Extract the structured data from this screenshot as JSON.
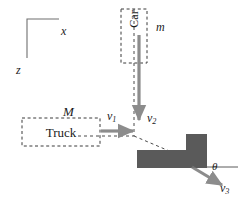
{
  "figure": {
    "background_color": "#ffffff",
    "ink_color": "#1b1b1b",
    "wreck_fill_color": "#5a5a5a",
    "arrow_color": "#8c8c8c",
    "dashed_color": "#4a4a4a"
  },
  "axes": {
    "x_label": "x",
    "z_label": "z",
    "origin_x": 27,
    "origin_y": 19,
    "x_end": 59,
    "z_end": 58
  },
  "bodies": [
    {
      "id": "car",
      "label": "Car",
      "mass_symbol": "m",
      "orientation": "vertical",
      "box": {
        "x": 121,
        "y": 9,
        "w": 26,
        "h": 54
      }
    },
    {
      "id": "truck",
      "label": "Truck",
      "mass_symbol": "M",
      "orientation": "horizontal",
      "box": {
        "x": 22,
        "y": 118,
        "w": 78,
        "h": 28
      }
    },
    {
      "id": "wreckage",
      "label": "",
      "shape": "L-polygon",
      "fill": "#5a5a5a"
    }
  ],
  "vectors": [
    {
      "id": "v1",
      "label": "v",
      "subscript": "1",
      "direction": "right",
      "belongs_to": "truck",
      "from": {
        "x": 103,
        "y": 131
      },
      "to": {
        "x": 135,
        "y": 131
      }
    },
    {
      "id": "v2",
      "label": "v",
      "subscript": "2",
      "direction": "down",
      "belongs_to": "car",
      "from": {
        "x": 139,
        "y": 37
      },
      "to": {
        "x": 139,
        "y": 123
      }
    },
    {
      "id": "v3",
      "label": "v",
      "subscript": "3",
      "direction": "down-right",
      "belongs_to": "wreckage",
      "from": {
        "x": 192,
        "y": 167
      },
      "to": {
        "x": 224,
        "y": 186
      }
    }
  ],
  "angle": {
    "symbol": "θ",
    "between": [
      "horizontal-reference",
      "v3"
    ],
    "vertex": {
      "x": 192,
      "y": 167
    }
  },
  "reference_line": {
    "id": "horizontal-reference",
    "from": {
      "x": 192,
      "y": 167
    },
    "to": {
      "x": 238,
      "y": 167
    }
  },
  "trajectories": [
    {
      "id": "car-path",
      "style": "dashed",
      "from": {
        "x": 134,
        "y": 9
      },
      "to": {
        "x": 134,
        "y": 136
      }
    },
    {
      "id": "truck-path",
      "style": "dashed",
      "from": {
        "x": 78,
        "y": 136
      },
      "to": {
        "x": 134,
        "y": 136
      }
    },
    {
      "id": "wreck-path",
      "style": "dashed",
      "from": {
        "x": 134,
        "y": 136
      },
      "to": {
        "x": 172,
        "y": 152
      }
    }
  ]
}
